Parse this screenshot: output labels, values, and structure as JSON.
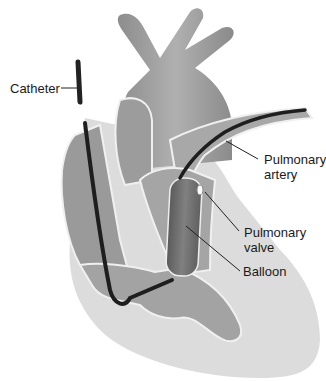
{
  "figure": {
    "labels": {
      "catheter": "Catheter",
      "pulmonary_artery": "Pulmonary\nartery",
      "pulmonary_valve": "Pulmonary\nvalve",
      "balloon": "Balloon"
    },
    "colors": {
      "heart_tissue": "#9a9a9a",
      "heart_light": "#d6d6d6",
      "chamber_dark": "#7a7a7a",
      "catheter": "#222222",
      "balloon": "#6e6e6e",
      "outline": "#eeeeee",
      "background": "#ffffff"
    }
  }
}
